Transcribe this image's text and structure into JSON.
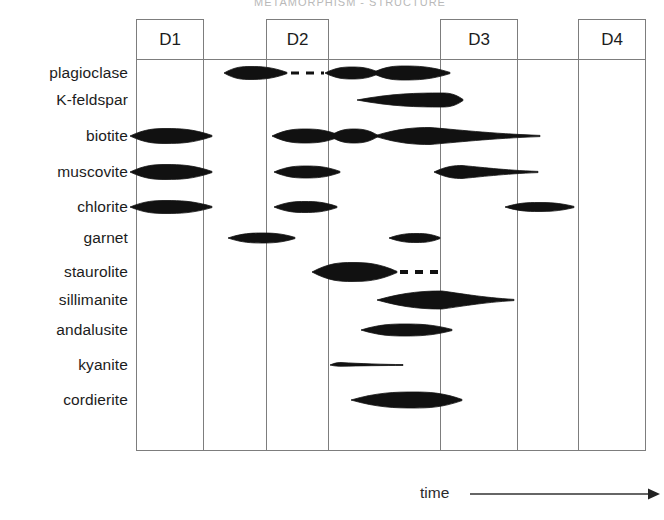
{
  "figure": {
    "title_faint": "METAMORPHISM  -  STRUCTURE",
    "axis_label": "time",
    "axis_arrow_icon": "arrow-right-icon",
    "frame_color": "#7d7d7d",
    "lens_color": "#111111"
  },
  "deformation_events": [
    {
      "label": "D1",
      "x0": 136,
      "x1": 203
    },
    {
      "label": "D2",
      "x0": 266,
      "x1": 328
    },
    {
      "label": "D3",
      "x0": 440,
      "x1": 517
    },
    {
      "label": "D4",
      "x0": 578,
      "x1": 645
    }
  ],
  "gridlines_x": [
    136,
    203,
    266,
    328,
    440,
    517,
    578,
    645
  ],
  "frame": {
    "left": 136,
    "right": 645,
    "top": 59,
    "bottom": 450
  },
  "minerals": [
    {
      "label": "plagioclase",
      "y": 73
    },
    {
      "label": "K-feldspar",
      "y": 100
    },
    {
      "label": "biotite",
      "y": 136
    },
    {
      "label": "muscovite",
      "y": 172
    },
    {
      "label": "chlorite",
      "y": 207
    },
    {
      "label": "garnet",
      "y": 238
    },
    {
      "label": "staurolite",
      "y": 272
    },
    {
      "label": "sillimanite",
      "y": 300
    },
    {
      "label": "andalusite",
      "y": 330
    },
    {
      "label": "kyanite",
      "y": 365
    },
    {
      "label": "cordierite",
      "y": 400
    }
  ],
  "chart_data": {
    "type": "range-chart",
    "xlabel": "time",
    "ylabel": "",
    "grid": true,
    "legend": "none",
    "x_categories": [
      "D1",
      "D2",
      "D3",
      "D4"
    ],
    "y_categories": [
      "plagioclase",
      "K-feldspar",
      "biotite",
      "muscovite",
      "chlorite",
      "garnet",
      "staurolite",
      "sillimanite",
      "andalusite",
      "kyanite",
      "cordierite"
    ],
    "series": [
      {
        "name": "plagioclase",
        "row": 0,
        "segments": [
          {
            "style": "lens",
            "x0": 224,
            "x1": 287,
            "peak": 250,
            "thickness": 13
          },
          {
            "style": "dashed",
            "x0": 291,
            "x1": 324,
            "thickness": 3
          },
          {
            "style": "lens",
            "x0": 325,
            "x1": 379,
            "peak": 352,
            "thickness": 12
          },
          {
            "style": "lens",
            "x0": 372,
            "x1": 450,
            "peak": 404,
            "thickness": 14
          }
        ]
      },
      {
        "name": "K-feldspar",
        "row": 1,
        "segments": [
          {
            "style": "lens",
            "x0": 357,
            "x1": 463,
            "peak": 442,
            "thickness": 14
          }
        ]
      },
      {
        "name": "biotite",
        "row": 2,
        "segments": [
          {
            "style": "lens",
            "x0": 130,
            "x1": 212,
            "peak": 166,
            "thickness": 15
          },
          {
            "style": "lens",
            "x0": 272,
            "x1": 340,
            "peak": 305,
            "thickness": 14
          },
          {
            "style": "lens",
            "x0": 330,
            "x1": 378,
            "peak": 354,
            "thickness": 14
          },
          {
            "style": "lens-tail",
            "x0": 374,
            "x1": 540,
            "peak": 430,
            "thickness": 17
          }
        ]
      },
      {
        "name": "muscovite",
        "row": 3,
        "segments": [
          {
            "style": "lens",
            "x0": 130,
            "x1": 212,
            "peak": 166,
            "thickness": 15
          },
          {
            "style": "lens",
            "x0": 274,
            "x1": 340,
            "peak": 306,
            "thickness": 12
          },
          {
            "style": "lens-tail",
            "x0": 434,
            "x1": 538,
            "peak": 462,
            "thickness": 13
          }
        ]
      },
      {
        "name": "chlorite",
        "row": 4,
        "segments": [
          {
            "style": "lens",
            "x0": 130,
            "x1": 212,
            "peak": 166,
            "thickness": 13
          },
          {
            "style": "lens",
            "x0": 274,
            "x1": 337,
            "peak": 305,
            "thickness": 11
          },
          {
            "style": "lens",
            "x0": 505,
            "x1": 574,
            "peak": 538,
            "thickness": 9
          }
        ]
      },
      {
        "name": "garnet",
        "row": 5,
        "segments": [
          {
            "style": "lens",
            "x0": 228,
            "x1": 295,
            "peak": 262,
            "thickness": 10
          }
        ]
      },
      {
        "name": "garnet-2",
        "row": 5,
        "segments": [
          {
            "style": "lens",
            "x0": 389,
            "x1": 440,
            "peak": 417,
            "thickness": 9
          }
        ]
      },
      {
        "name": "staurolite",
        "row": 6,
        "segments": [
          {
            "style": "lens",
            "x0": 312,
            "x1": 397,
            "peak": 352,
            "thickness": 19
          },
          {
            "style": "dashed",
            "x0": 400,
            "x1": 441,
            "thickness": 4
          }
        ]
      },
      {
        "name": "sillimanite",
        "row": 7,
        "segments": [
          {
            "style": "lens-tail",
            "x0": 377,
            "x1": 514,
            "peak": 442,
            "thickness": 18
          }
        ]
      },
      {
        "name": "andalusite",
        "row": 8,
        "segments": [
          {
            "style": "lens",
            "x0": 361,
            "x1": 452,
            "peak": 405,
            "thickness": 12
          }
        ]
      },
      {
        "name": "kyanite",
        "row": 9,
        "segments": [
          {
            "style": "lens-thin",
            "x0": 330,
            "x1": 403,
            "peak": 341,
            "thickness": 5
          }
        ]
      },
      {
        "name": "cordierite",
        "row": 10,
        "segments": [
          {
            "style": "lens",
            "x0": 351,
            "x1": 462,
            "peak": 414,
            "thickness": 16
          }
        ]
      }
    ]
  }
}
